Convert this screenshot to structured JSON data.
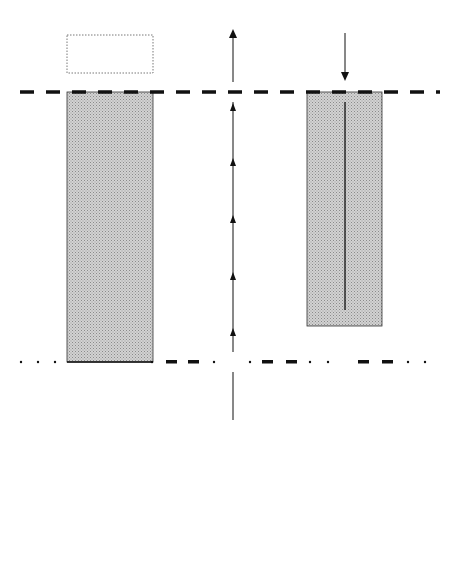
{
  "zones": {
    "hot": {
      "line1": "HOT",
      "line2": "ZONE"
    },
    "warm": {
      "line1": "WARM",
      "line2": "ZONE"
    },
    "cold": {
      "line1": "COLD",
      "line2": "ZONE"
    }
  },
  "areas": {
    "heavy_equipment": {
      "line1": "Heavy Equipment",
      "line2": "Decontamination",
      "line3": "Area"
    },
    "auxiliary_path": {
      "line1": "Auxiliary",
      "line2": "Access",
      "line3": "Control Path"
    },
    "contamination_corridor": {
      "line1": "Contamination",
      "line2": "Reduction",
      "line3": "Corridor"
    },
    "dressout": {
      "line1": "Dressout",
      "line2": "Area"
    },
    "redress": {
      "line1": "Redress",
      "line2": "Area"
    }
  },
  "labels": {
    "exit_path": {
      "line1": "Exit",
      "line2": "Path"
    },
    "entry": "Entry"
  },
  "legend": {
    "title": "LEGEND",
    "items": [
      {
        "symbol": "hotline",
        "label": "Hotline"
      },
      {
        "symbol": "contamination-control-line",
        "label": "Contamination Control Line"
      },
      {
        "symbol": "access-control-entrance",
        "label": "Access Control-Entrance"
      },
      {
        "symbol": "access-control-exit",
        "label": "Access Control-Exit"
      }
    ]
  },
  "colors": {
    "line": "#111111",
    "shaded_area": "#c8c8c8",
    "dotted_border": "#555555"
  }
}
